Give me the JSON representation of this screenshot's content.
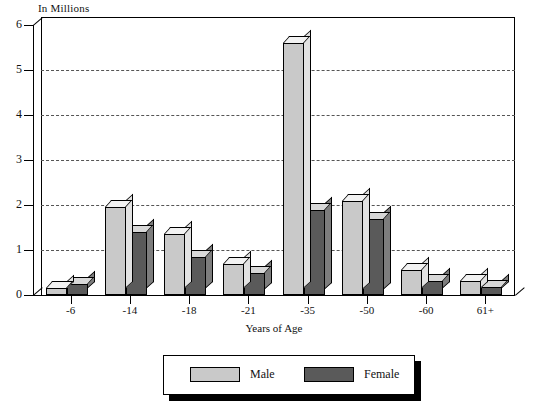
{
  "chart_data": {
    "type": "bar",
    "title": "",
    "ylabel": "In Millions",
    "xlabel": "Years of Age",
    "categories": [
      "-6",
      "-14",
      "-18",
      "-21",
      "-35",
      "-50",
      "-60",
      "61+"
    ],
    "series": [
      {
        "name": "Male",
        "color": "#c9c9c9",
        "values": [
          0.15,
          1.95,
          1.35,
          0.68,
          5.6,
          2.1,
          0.55,
          0.32
        ]
      },
      {
        "name": "Female",
        "color": "#5a5a5a",
        "values": [
          0.25,
          1.4,
          0.85,
          0.5,
          1.9,
          1.7,
          0.32,
          0.18
        ]
      }
    ],
    "ylim": [
      0,
      6
    ],
    "yticks": [
      "0",
      "1",
      "2",
      "3",
      "4",
      "5",
      "6"
    ],
    "grid": true,
    "legend_position": "bottom"
  },
  "legend": {
    "male_label": "Male",
    "female_label": "Female"
  }
}
